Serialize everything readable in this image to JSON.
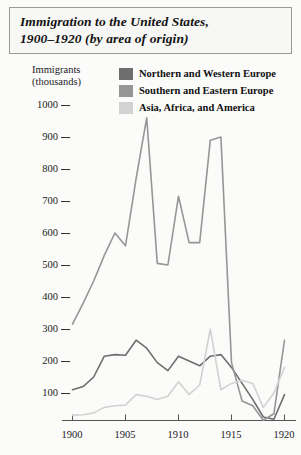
{
  "figure": {
    "title_line1": "Immigration to the United States,",
    "title_line2": "1900–1920 (by area of origin)",
    "background": "#fbfbfa",
    "border_color": "#9a9a96"
  },
  "axis": {
    "y_title_line1": "Immigrants",
    "y_title_line2": "(thousands)",
    "y_ticks": [
      "1000",
      "900",
      "800",
      "700",
      "600",
      "500",
      "400",
      "300",
      "200",
      "100"
    ],
    "x_ticks": [
      "1900",
      "1905",
      "1910",
      "1915",
      "1920"
    ],
    "axis_color": "#555555"
  },
  "legend": {
    "items": [
      {
        "label": "Northern and Western Europe",
        "color": "#6e6e6e"
      },
      {
        "label": "Southern and Eastern Europe",
        "color": "#969696"
      },
      {
        "label": "Asia, Africa, and America",
        "color": "#d2d2d2"
      }
    ]
  },
  "chart_data": {
    "type": "line",
    "title": "Immigration to the United States, 1900–1920 (by area of origin)",
    "xlabel": "",
    "ylabel": "Immigrants (thousands)",
    "xlim": [
      1900,
      1920
    ],
    "ylim": [
      0,
      1000
    ],
    "grid": false,
    "legend_position": "top-right",
    "x": [
      1900,
      1901,
      1902,
      1903,
      1904,
      1905,
      1906,
      1907,
      1908,
      1909,
      1910,
      1911,
      1912,
      1913,
      1914,
      1915,
      1916,
      1917,
      1918,
      1919,
      1920
    ],
    "series": [
      {
        "name": "Northern and Western Europe",
        "color": "#6e6e6e",
        "values": [
          110,
          120,
          150,
          215,
          220,
          218,
          265,
          240,
          195,
          170,
          215,
          200,
          185,
          215,
          220,
          180,
          130,
          80,
          25,
          18,
          95
        ]
      },
      {
        "name": "Southern and Eastern Europe",
        "color": "#969696",
        "values": [
          315,
          380,
          450,
          530,
          600,
          560,
          770,
          960,
          505,
          500,
          715,
          570,
          570,
          890,
          900,
          195,
          75,
          60,
          15,
          35,
          265
        ]
      },
      {
        "name": "Asia, Africa, and America",
        "color": "#d2d2d2",
        "values": [
          30,
          32,
          38,
          55,
          60,
          62,
          95,
          90,
          80,
          90,
          135,
          95,
          125,
          300,
          110,
          130,
          140,
          130,
          55,
          100,
          180
        ]
      }
    ]
  }
}
